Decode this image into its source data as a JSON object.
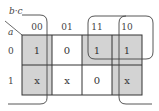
{
  "kmap": {
    "row_variable": "a",
    "column_variables": "b·c",
    "column_headers": [
      "00",
      "01",
      "11",
      "10"
    ],
    "row_headers": [
      "0",
      "1"
    ],
    "cells": [
      [
        "1",
        "0",
        "1",
        "1"
      ],
      [
        "x",
        "x",
        "0",
        "x"
      ]
    ],
    "shaded_cells": [
      [
        0,
        0
      ],
      [
        1,
        0
      ],
      [
        0,
        2
      ],
      [
        0,
        3
      ],
      [
        1,
        3
      ]
    ],
    "groups": [
      {
        "name": "column-00-group",
        "cells": [
          [
            0,
            0
          ],
          [
            1,
            0
          ]
        ]
      },
      {
        "name": "column-10-group",
        "cells": [
          [
            0,
            3
          ],
          [
            1,
            3
          ]
        ]
      },
      {
        "name": "row0-11-10-group",
        "cells": [
          [
            0,
            2
          ],
          [
            0,
            3
          ]
        ]
      }
    ],
    "colors": {
      "shade": "#d3d3d3",
      "line": "#333333",
      "background": "#ffffff"
    }
  }
}
